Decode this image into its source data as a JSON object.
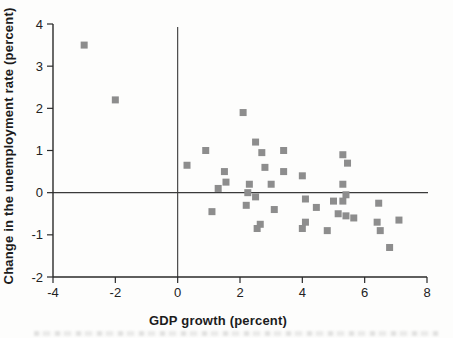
{
  "chart_data": {
    "type": "scatter",
    "title": "",
    "xlabel": "GDP growth (percent)",
    "ylabel": "Change in the unemployment rate (percent)",
    "xlim": [
      -4,
      8
    ],
    "ylim": [
      -2,
      4
    ],
    "x_ticks": [
      -4,
      -2,
      0,
      2,
      4,
      6,
      8
    ],
    "x_tick_labels": [
      "-4",
      "-2",
      "0",
      "2",
      "4",
      "6",
      "8"
    ],
    "y_ticks": [
      -2,
      -1,
      0,
      1,
      2,
      3,
      4
    ],
    "y_tick_labels": [
      "-2",
      "-1",
      "0",
      "1",
      "2",
      "3",
      "4"
    ],
    "grid": false,
    "legend": null,
    "reference_lines": {
      "vertical_at_x": 0,
      "horizontal_at_y": 0
    },
    "marker": {
      "shape": "square",
      "size_px": 7,
      "color": "#8d8d8d"
    },
    "axis_color": "#2a2a2a",
    "points": [
      [
        -3.0,
        3.5
      ],
      [
        -2.0,
        2.2
      ],
      [
        0.3,
        0.65
      ],
      [
        0.9,
        1.0
      ],
      [
        1.3,
        0.1
      ],
      [
        1.5,
        0.5
      ],
      [
        1.55,
        0.25
      ],
      [
        1.1,
        -0.45
      ],
      [
        2.1,
        1.9
      ],
      [
        2.5,
        1.2
      ],
      [
        2.7,
        0.95
      ],
      [
        2.8,
        0.6
      ],
      [
        2.3,
        0.2
      ],
      [
        2.25,
        0.0
      ],
      [
        2.5,
        -0.1
      ],
      [
        2.2,
        -0.3
      ],
      [
        2.55,
        -0.85
      ],
      [
        2.65,
        -0.75
      ],
      [
        3.4,
        1.0
      ],
      [
        3.4,
        0.5
      ],
      [
        3.0,
        0.2
      ],
      [
        3.1,
        -0.4
      ],
      [
        4.0,
        0.4
      ],
      [
        4.1,
        -0.15
      ],
      [
        4.45,
        -0.35
      ],
      [
        4.1,
        -0.7
      ],
      [
        4.0,
        -0.85
      ],
      [
        4.8,
        -0.9
      ],
      [
        5.3,
        0.9
      ],
      [
        5.45,
        0.7
      ],
      [
        5.3,
        0.2
      ],
      [
        5.4,
        -0.05
      ],
      [
        5.0,
        -0.2
      ],
      [
        5.3,
        -0.2
      ],
      [
        5.15,
        -0.5
      ],
      [
        5.4,
        -0.55
      ],
      [
        5.65,
        -0.6
      ],
      [
        6.45,
        -0.25
      ],
      [
        6.4,
        -0.7
      ],
      [
        6.5,
        -0.9
      ],
      [
        7.1,
        -0.65
      ],
      [
        6.8,
        -1.3
      ]
    ]
  }
}
